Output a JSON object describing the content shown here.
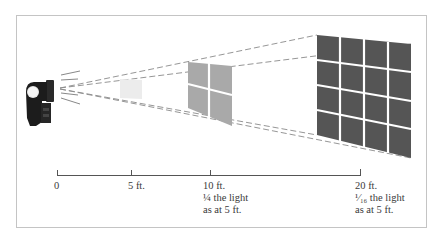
{
  "diagram": {
    "colors": {
      "frame": "#c4c4c4",
      "flash_body": "#1c1c1c",
      "square_5ft": "#ececec",
      "square_10ft": "#a9a9a9",
      "square_20ft": "#555555",
      "dashed_lines": "#888888",
      "axis": "#555555",
      "text": "#3a3a3a"
    },
    "light_source": {
      "label": "flash-unit"
    },
    "targets": [
      {
        "distance": "5 ft.",
        "grid": "1x1",
        "shade": "lightest"
      },
      {
        "distance": "10 ft.",
        "grid": "2x2",
        "shade": "medium"
      },
      {
        "distance": "20 ft.",
        "grid": "4x4",
        "shade": "darkest"
      }
    ],
    "axis": {
      "ticks": [
        {
          "label": "0"
        },
        {
          "label": "5 ft."
        },
        {
          "label": "10 ft.",
          "note_line1_fraction": "¼",
          "note_line1_rest": " the light",
          "note_line2": "as at 5 ft."
        },
        {
          "label": "20 ft.",
          "note_line1_fraction": "¹⁄₁₆",
          "note_line1_rest": " the light",
          "note_line2": "as at 5 ft."
        }
      ]
    }
  }
}
